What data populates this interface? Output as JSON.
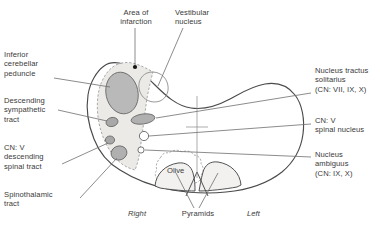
{
  "figure": {
    "type": "anatomical-cross-section-diagram"
  },
  "labels": {
    "area_of_infarction": "Area of\ninfarction",
    "vestibular_nucleus": "Vestibular\nnucleus",
    "inferior_cerebellar_peduncle": "Inferior\ncerebellar\npeduncle",
    "descending_sympathetic_tract": "Descending\nsympathetic\ntract",
    "cn_v_descending_spinal_tract": "CN: V\ndescending\nspinal tract",
    "spinothalamic_tract": "Spinothalamic\ntract",
    "nucleus_tractus_solitarius": "Nucleus tractus\nsolitarius\n(CN: VII, IX, X)",
    "cn_v_spinal_nucleus": "CN: V\nspinal nucleus",
    "nucleus_ambiguus": "Nucleus\nambiguus\n(CN: IX, X)",
    "olive": "Olive",
    "pyramids": "Pyramids",
    "side_right": "Right",
    "side_left": "Left"
  },
  "colors": {
    "outline": "#4a4a4a",
    "leader_line": "#6f6f6f",
    "infarct_fill": "#eceae6",
    "infarct_border": "#9a9a9a",
    "peduncle_fill": "#b9b9b9",
    "nucleus_fill": "#b0b0b0",
    "pyramid_fill": "#f2f1ef",
    "text": "#3a3a3a",
    "background": "#ffffff",
    "infarct_marker": "#161616"
  }
}
